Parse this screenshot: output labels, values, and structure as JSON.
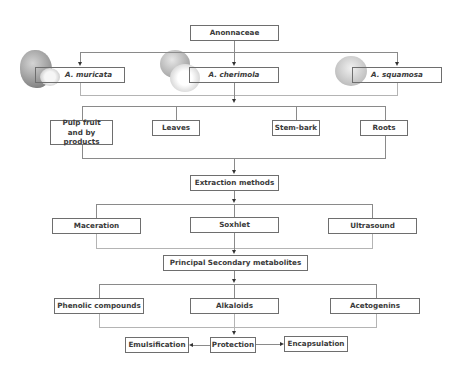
{
  "diagram": {
    "root": {
      "label": "Anonnaceae"
    },
    "species": [
      {
        "label": "A. muricata",
        "image": "soursop-fruit-image"
      },
      {
        "label": "A. cherimola",
        "image": "cherimoya-fruit-image"
      },
      {
        "label": "A. squamosa",
        "image": "sugar-apple-fruit-image"
      }
    ],
    "plant_parts": [
      {
        "label": "Pulp fruit and by products"
      },
      {
        "label": "Leaves"
      },
      {
        "label": "Stem-bark"
      },
      {
        "label": "Roots"
      }
    ],
    "extraction": {
      "label": "Extraction methods"
    },
    "methods": [
      {
        "label": "Maceration"
      },
      {
        "label": "Soxhlet"
      },
      {
        "label": "Ultrasound"
      }
    ],
    "metabolites_header": {
      "label": "Principal Secondary metabolites"
    },
    "metabolites": [
      {
        "label": "Phenolic compounds"
      },
      {
        "label": "Alkaloids"
      },
      {
        "label": "Acetogenins"
      }
    ],
    "protection": {
      "label": "Protection"
    },
    "protection_methods": [
      {
        "label": "Emulsification"
      },
      {
        "label": "Encapsulation"
      }
    ],
    "colors": {
      "line": "#8a8a8a",
      "border": "#6e6e6e",
      "text": "#3a3a3a",
      "arrow": "#333333"
    }
  }
}
